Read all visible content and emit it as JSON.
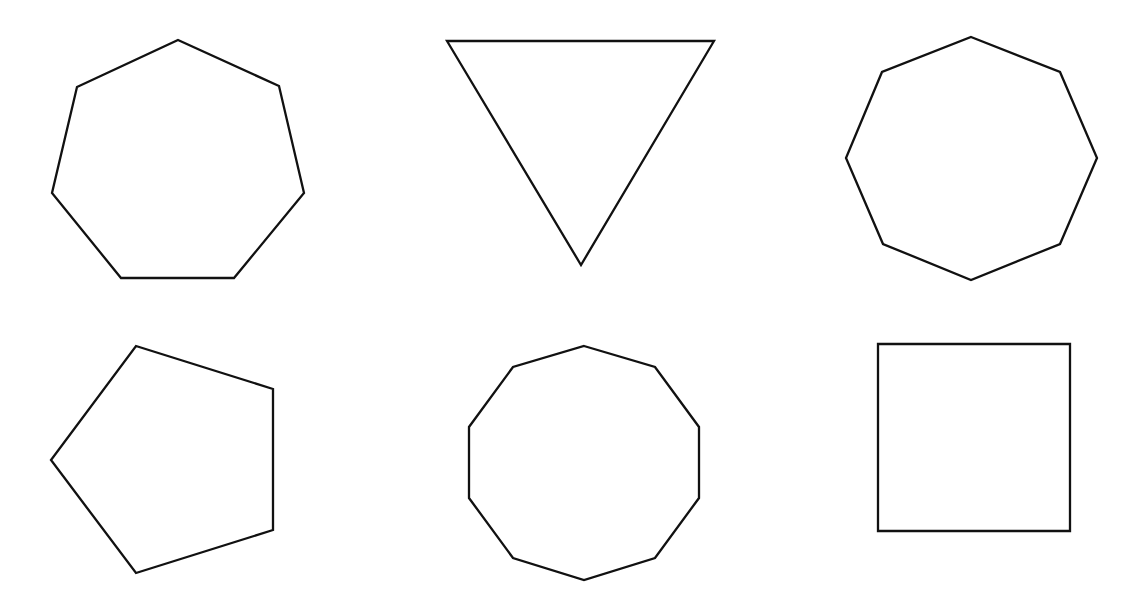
{
  "canvas": {
    "width": 1142,
    "height": 603,
    "background": "#ffffff",
    "stroke_color": "#111111",
    "stroke_width": 2.3
  },
  "shapes": [
    {
      "name": "heptagon",
      "sides": 7,
      "points": "178,40 279,86 304,193 234,278 121,278 52,193 77,87"
    },
    {
      "name": "triangle-inverted",
      "sides": 3,
      "points": "447,41 714,41 581,265"
    },
    {
      "name": "octagon",
      "sides": 8,
      "points": "971,37 1060,72 1097,158 1060,244 971,280 883,244 846,158 882,72"
    },
    {
      "name": "pentagon",
      "sides": 5,
      "points": "136,346 273,389 273,530 136,573 51,460"
    },
    {
      "name": "decagon",
      "sides": 10,
      "points": "584,346 655,367 699,427 699,498 655,558 584,580 513,558 469,498 469,427 513,367"
    },
    {
      "name": "square",
      "sides": 4,
      "points": "878,344 1070,344 1070,531 878,531"
    }
  ]
}
